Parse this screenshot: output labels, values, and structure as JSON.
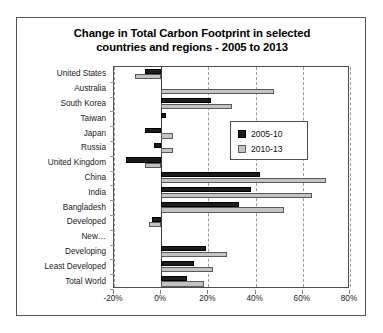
{
  "chart_data": {
    "type": "bar",
    "orientation": "horizontal",
    "title": "Change in Total Carbon Footprint in selected countries and regions - 2005 to 2013",
    "title_line1": "Change in Total Carbon Footprint in selected",
    "title_line2": "countries and regions - 2005 to 2013",
    "xlabel": "",
    "ylabel": "",
    "xlim": [
      -20,
      80
    ],
    "xticks": [
      -20,
      0,
      20,
      40,
      60,
      80
    ],
    "xtick_labels": [
      "-20%",
      "0%",
      "20%",
      "40%",
      "60%",
      "80%"
    ],
    "grid": true,
    "legend_position": "upper right inside plot",
    "categories": [
      "United States",
      "Australia",
      "South Korea",
      "Taiwan",
      "Japan",
      "Russia",
      "United Kingdom",
      "China",
      "India",
      "Bangladesh",
      "Developed",
      "New…",
      "Developing",
      "Least Developed",
      "Total World"
    ],
    "series": [
      {
        "name": "2005-10",
        "color": "#1c1c1c",
        "values": [
          -7,
          0,
          21,
          2,
          -7,
          -3,
          -15,
          42,
          38,
          33,
          -4,
          0,
          19,
          14,
          11
        ]
      },
      {
        "name": "2010-13",
        "color": "#c3c3c3",
        "values": [
          -11,
          48,
          30,
          0,
          5,
          5,
          -7,
          70,
          64,
          52,
          -5,
          0,
          28,
          22,
          18
        ]
      }
    ]
  },
  "legend": {
    "items": [
      {
        "label": "2005-10"
      },
      {
        "label": "2010-13"
      }
    ]
  }
}
